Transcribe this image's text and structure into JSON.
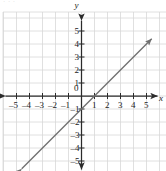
{
  "figure": {
    "kind": "coordinate-plane-graph",
    "width": 166,
    "height": 171,
    "background_color": "#ffffff",
    "grid_color": "#d8d8d8",
    "axis_color": "#2b2b2b",
    "line_color": "#6f6f6f",
    "label_color": "#1b1b1b",
    "top_artifact_text": "·  ·          ·"
  },
  "axes": {
    "x_axis_name": "x",
    "y_axis_name": "y",
    "origin_label": "0",
    "x_tick_labels": [
      "–5",
      "–4",
      "–3",
      "–2",
      "–1",
      "1",
      "2",
      "3",
      "4",
      "5"
    ],
    "y_tick_labels": [
      "5",
      "4",
      "3",
      "2",
      "1",
      "–1",
      "–2",
      "–3",
      "–4",
      "–5"
    ],
    "x_tick_values": [
      -5,
      -4,
      -3,
      -2,
      -1,
      1,
      2,
      3,
      4,
      5
    ],
    "y_tick_values": [
      5,
      4,
      3,
      2,
      1,
      -1,
      -2,
      -3,
      -4,
      -5
    ],
    "x_arrow_left": true,
    "x_arrow_right": true,
    "y_arrow_up": true,
    "y_arrow_down": true
  },
  "chart_data": {
    "type": "line",
    "title": "",
    "subtitle": "",
    "xlabel": "x",
    "ylabel": "y",
    "xlim": [
      -5.8,
      5.8
    ],
    "ylim": [
      -5.8,
      5.8
    ],
    "xticks": [
      -5,
      -4,
      -3,
      -2,
      -1,
      0,
      1,
      2,
      3,
      4,
      5
    ],
    "yticks": [
      -5,
      -4,
      -3,
      -2,
      -1,
      0,
      1,
      2,
      3,
      4,
      5
    ],
    "grid": true,
    "grid_spacing": 1,
    "legend": "none",
    "annotations": [],
    "series": [
      {
        "name": "y = x - 1",
        "equation": "y = x - 1",
        "slope": 1,
        "intercept": -1,
        "style": "solid",
        "arrows": "both",
        "x": [
          -4.6,
          -4,
          -3,
          -2,
          -1,
          0,
          1,
          2,
          3,
          4,
          5,
          5.4
        ],
        "values": [
          -5.6,
          -5,
          -4,
          -3,
          -2,
          -1,
          0,
          1,
          2,
          3,
          4,
          4.4
        ],
        "key_points": [
          {
            "x": 0,
            "y": -1,
            "note": "y-intercept"
          },
          {
            "x": 1,
            "y": 0,
            "note": "x-intercept"
          }
        ]
      }
    ]
  }
}
